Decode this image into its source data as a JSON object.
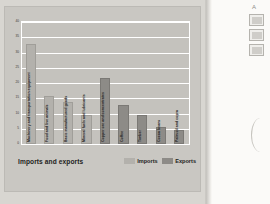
{
  "document": {
    "caption": "Imports and exports",
    "margin_marker": "A"
  },
  "legend": {
    "items": [
      {
        "key": "imports",
        "label": "Imports",
        "color": "#b3b1ac"
      },
      {
        "key": "exports",
        "label": "Exports",
        "color": "#8d8b87"
      }
    ]
  },
  "chart_data": {
    "type": "bar",
    "title": "Imports and exports",
    "xlabel": "",
    "ylabel": "Percentage of total",
    "ylim": [
      0,
      40
    ],
    "yticks": [
      0,
      5,
      10,
      15,
      20,
      25,
      30,
      35,
      40
    ],
    "grid": true,
    "legend_position": "bottom-right",
    "categories": [
      "Machinery and transportation equipment",
      "Food and live animals",
      "Basic manufactured goods",
      "Mineral fuels and lubricants",
      "Copper ore and concentrates",
      "Coffee",
      "Timber",
      "Cocoa beans",
      "Palm oil and copra"
    ],
    "series": [
      {
        "name": "Imports",
        "color": "#b3b1ac",
        "values": [
          32,
          15,
          13,
          9,
          null,
          null,
          null,
          null,
          null
        ]
      },
      {
        "name": "Exports",
        "color": "#8d8b87",
        "values": [
          null,
          null,
          null,
          null,
          21,
          12,
          9,
          5,
          4
        ]
      }
    ],
    "bars": [
      {
        "category": "Machinery and transportation equipment",
        "series": "Imports",
        "value": 32
      },
      {
        "category": "Food and live animals",
        "series": "Imports",
        "value": 15
      },
      {
        "category": "Basic manufactured goods",
        "series": "Imports",
        "value": 13
      },
      {
        "category": "Mineral fuels and lubricants",
        "series": "Imports",
        "value": 9
      },
      {
        "category": "Copper ore and concentrates",
        "series": "Exports",
        "value": 21
      },
      {
        "category": "Coffee",
        "series": "Exports",
        "value": 12
      },
      {
        "category": "Timber",
        "series": "Exports",
        "value": 9
      },
      {
        "category": "Cocoa beans",
        "series": "Exports",
        "value": 5
      },
      {
        "category": "Palm oil and copra",
        "series": "Exports",
        "value": 4
      }
    ]
  }
}
